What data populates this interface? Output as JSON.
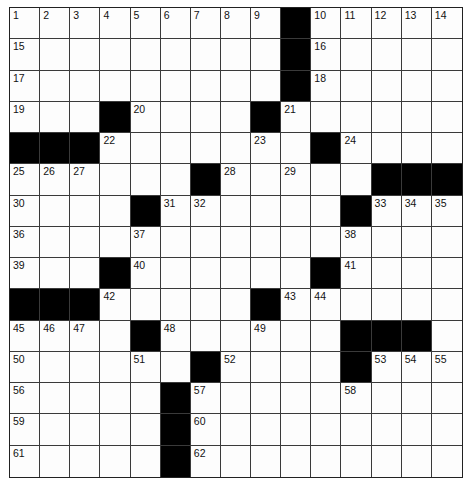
{
  "puzzle": {
    "rows": 15,
    "cols": 15,
    "grid": [
      ".........#.....",
      ".........#.....",
      ".........#.....",
      "...#....#......",
      "###.......#....",
      "......#.....###",
      "....#......#...",
      "...............",
      "...#......#....",
      "###.....#......",
      "....#......###.",
      "......#....#...",
      ".....#.........",
      ".....#.........",
      ".....#........."
    ],
    "numbers": [
      {
        "r": 0,
        "c": 0,
        "n": "1"
      },
      {
        "r": 0,
        "c": 1,
        "n": "2"
      },
      {
        "r": 0,
        "c": 2,
        "n": "3"
      },
      {
        "r": 0,
        "c": 3,
        "n": "4"
      },
      {
        "r": 0,
        "c": 4,
        "n": "5"
      },
      {
        "r": 0,
        "c": 5,
        "n": "6"
      },
      {
        "r": 0,
        "c": 6,
        "n": "7"
      },
      {
        "r": 0,
        "c": 7,
        "n": "8"
      },
      {
        "r": 0,
        "c": 8,
        "n": "9"
      },
      {
        "r": 0,
        "c": 10,
        "n": "10"
      },
      {
        "r": 0,
        "c": 11,
        "n": "11"
      },
      {
        "r": 0,
        "c": 12,
        "n": "12"
      },
      {
        "r": 0,
        "c": 13,
        "n": "13"
      },
      {
        "r": 0,
        "c": 14,
        "n": "14"
      },
      {
        "r": 1,
        "c": 0,
        "n": "15"
      },
      {
        "r": 1,
        "c": 10,
        "n": "16"
      },
      {
        "r": 2,
        "c": 0,
        "n": "17"
      },
      {
        "r": 2,
        "c": 10,
        "n": "18"
      },
      {
        "r": 3,
        "c": 0,
        "n": "19"
      },
      {
        "r": 3,
        "c": 4,
        "n": "20"
      },
      {
        "r": 3,
        "c": 9,
        "n": "21"
      },
      {
        "r": 4,
        "c": 3,
        "n": "22"
      },
      {
        "r": 4,
        "c": 8,
        "n": "23"
      },
      {
        "r": 4,
        "c": 11,
        "n": "24"
      },
      {
        "r": 5,
        "c": 0,
        "n": "25"
      },
      {
        "r": 5,
        "c": 1,
        "n": "26"
      },
      {
        "r": 5,
        "c": 2,
        "n": "27"
      },
      {
        "r": 5,
        "c": 7,
        "n": "28"
      },
      {
        "r": 5,
        "c": 9,
        "n": "29"
      },
      {
        "r": 6,
        "c": 0,
        "n": "30"
      },
      {
        "r": 6,
        "c": 5,
        "n": "31"
      },
      {
        "r": 6,
        "c": 6,
        "n": "32"
      },
      {
        "r": 6,
        "c": 12,
        "n": "33"
      },
      {
        "r": 6,
        "c": 13,
        "n": "34"
      },
      {
        "r": 6,
        "c": 14,
        "n": "35"
      },
      {
        "r": 7,
        "c": 0,
        "n": "36"
      },
      {
        "r": 7,
        "c": 4,
        "n": "37"
      },
      {
        "r": 7,
        "c": 11,
        "n": "38"
      },
      {
        "r": 8,
        "c": 0,
        "n": "39"
      },
      {
        "r": 8,
        "c": 4,
        "n": "40"
      },
      {
        "r": 8,
        "c": 11,
        "n": "41"
      },
      {
        "r": 9,
        "c": 3,
        "n": "42"
      },
      {
        "r": 9,
        "c": 9,
        "n": "43"
      },
      {
        "r": 9,
        "c": 10,
        "n": "44"
      },
      {
        "r": 10,
        "c": 0,
        "n": "45"
      },
      {
        "r": 10,
        "c": 1,
        "n": "46"
      },
      {
        "r": 10,
        "c": 2,
        "n": "47"
      },
      {
        "r": 10,
        "c": 5,
        "n": "48"
      },
      {
        "r": 10,
        "c": 8,
        "n": "49"
      },
      {
        "r": 11,
        "c": 0,
        "n": "50"
      },
      {
        "r": 11,
        "c": 4,
        "n": "51"
      },
      {
        "r": 11,
        "c": 7,
        "n": "52"
      },
      {
        "r": 11,
        "c": 12,
        "n": "53"
      },
      {
        "r": 11,
        "c": 13,
        "n": "54"
      },
      {
        "r": 11,
        "c": 14,
        "n": "55"
      },
      {
        "r": 12,
        "c": 0,
        "n": "56"
      },
      {
        "r": 12,
        "c": 6,
        "n": "57"
      },
      {
        "r": 12,
        "c": 11,
        "n": "58"
      },
      {
        "r": 13,
        "c": 0,
        "n": "59"
      },
      {
        "r": 13,
        "c": 6,
        "n": "60"
      },
      {
        "r": 14,
        "c": 0,
        "n": "61"
      },
      {
        "r": 14,
        "c": 6,
        "n": "62"
      }
    ]
  }
}
